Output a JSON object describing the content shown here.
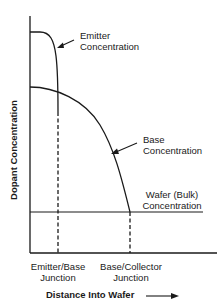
{
  "diagram": {
    "type": "dopant-profile",
    "y_axis_label": "Dopant Concentration",
    "x_axis_label": "Distance Into Wafer",
    "curves": [
      {
        "name": "emitter",
        "label_line1": "Emitter",
        "label_line2": "Concentration"
      },
      {
        "name": "base",
        "label_line1": "Base",
        "label_line2": "Concentration"
      },
      {
        "name": "wafer",
        "label_line1": "Wafer (Bulk)",
        "label_line2": "Concentration"
      }
    ],
    "junctions": [
      {
        "name": "emitter-base",
        "label_line1": "Emitter/Base",
        "label_line2": "Junction"
      },
      {
        "name": "base-collector",
        "label_line1": "Base/Collector",
        "label_line2": "Junction"
      }
    ],
    "colors": {
      "line": "#1a1a1a",
      "background": "#ffffff"
    }
  }
}
